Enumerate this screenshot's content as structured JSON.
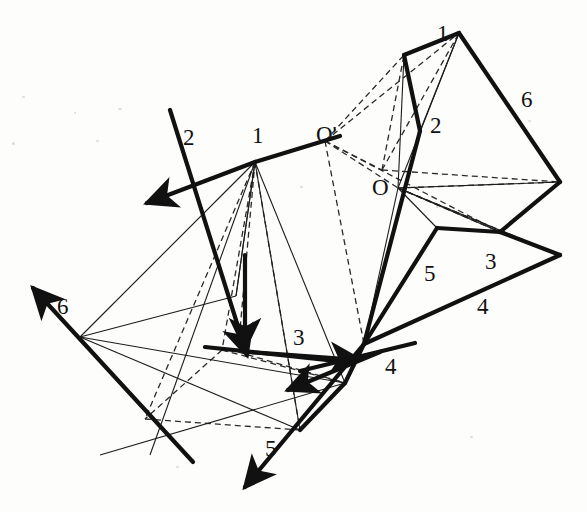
{
  "figure": {
    "background_color": "#fdfdfc",
    "ink_color": "#111111",
    "width": 587,
    "height": 512
  },
  "labels": [
    {
      "id": "left-2",
      "text": "2",
      "x": 183,
      "y": 126
    },
    {
      "id": "left-1",
      "text": "1",
      "x": 252,
      "y": 124
    },
    {
      "id": "o-prime",
      "text": "O'",
      "x": 316,
      "y": 123
    },
    {
      "id": "right-1",
      "text": "1",
      "x": 437,
      "y": 22
    },
    {
      "id": "right-6",
      "text": "6",
      "x": 521,
      "y": 88
    },
    {
      "id": "right-2",
      "text": "2",
      "x": 430,
      "y": 114
    },
    {
      "id": "o-point",
      "text": "O",
      "x": 372,
      "y": 176
    },
    {
      "id": "right-3",
      "text": "3",
      "x": 485,
      "y": 250
    },
    {
      "id": "right-5",
      "text": "5",
      "x": 424,
      "y": 262
    },
    {
      "id": "right-4",
      "text": "4",
      "x": 477,
      "y": 295
    },
    {
      "id": "left-6",
      "text": "6",
      "x": 57,
      "y": 295
    },
    {
      "id": "left-3",
      "text": "3",
      "x": 293,
      "y": 326
    },
    {
      "id": "left-4",
      "text": "4",
      "x": 385,
      "y": 355
    },
    {
      "id": "left-5",
      "text": "5",
      "x": 265,
      "y": 437
    }
  ],
  "strokes": {
    "thick_width": 4.2,
    "thin_width": 1.1,
    "dashed_width": 1.3,
    "dash_pattern": "6,4"
  },
  "right_solid": {
    "name": "compact-polyhedron",
    "center_label": "O",
    "center": [
      398,
      188
    ],
    "vertices": {
      "apex_top": [
        459,
        33
      ],
      "upper_left": [
        404,
        55
      ],
      "right": [
        560,
        182
      ],
      "lower_right": [
        560,
        255
      ],
      "bottom": [
        364,
        344
      ],
      "mid_right": [
        500,
        232
      ],
      "o": [
        398,
        188
      ]
    },
    "thick_outline": [
      [
        404,
        55
      ],
      [
        459,
        33
      ],
      [
        560,
        182
      ],
      [
        500,
        232
      ],
      [
        560,
        255
      ],
      [
        364,
        344
      ],
      [
        398,
        188
      ],
      [
        404,
        55
      ]
    ]
  },
  "left_solid": {
    "name": "unfolded-polyhedron",
    "apex_label": "O'",
    "apex": [
      325,
      141
    ],
    "hub": [
      255,
      162
    ],
    "base_vertices": [
      [
        80,
        337
      ],
      [
        236,
        296
      ],
      [
        345,
        383
      ],
      [
        300,
        430
      ],
      [
        150,
        455
      ]
    ]
  },
  "arrows": [
    {
      "id": "arrow-1",
      "label": "1",
      "from": [
        255,
        162
      ],
      "to": [
        147,
        203
      ],
      "kind": "thick"
    },
    {
      "id": "arrow-2",
      "label": "2",
      "from": [
        170,
        110
      ],
      "to": [
        247,
        355
      ],
      "kind": "thick"
    },
    {
      "id": "arrow-3",
      "label": "3",
      "from": [
        245,
        255
      ],
      "to": [
        245,
        348
      ],
      "kind": "thick"
    },
    {
      "id": "arrow-4",
      "label": "4",
      "from": [
        205,
        347
      ],
      "to": [
        360,
        360
      ],
      "kind": "thick"
    },
    {
      "id": "arrow-5",
      "label": "5",
      "from": [
        360,
        380
      ],
      "to": [
        245,
        487
      ],
      "kind": "thick"
    },
    {
      "id": "arrow-6",
      "label": "6",
      "from": [
        193,
        462
      ],
      "to": [
        33,
        288
      ],
      "kind": "thick"
    }
  ],
  "numbered_faces": [
    "1",
    "2",
    "3",
    "4",
    "5",
    "6"
  ]
}
